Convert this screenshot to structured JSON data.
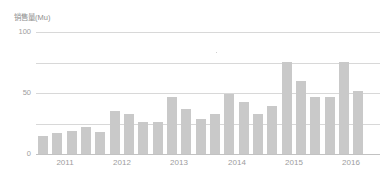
{
  "chart_data": {
    "type": "bar",
    "title": "",
    "subtitle": "",
    "xlabel": "",
    "ylabel": "销售量(Mu)",
    "ylim": [
      0,
      100
    ],
    "yticks": [
      0,
      50,
      100
    ],
    "ytick_labels": [
      "0",
      "50",
      "100"
    ],
    "gridlines": [
      0,
      25,
      50,
      75,
      100
    ],
    "grid": true,
    "legend": false,
    "legend_position": "none",
    "xtick_labels": [
      "2011",
      "2012",
      "2013",
      "2014",
      "2015",
      "2016"
    ],
    "categories": [
      "2011 Q1",
      "2011 Q2",
      "2011 Q3",
      "2011 Q4",
      "2012 Q1",
      "2012 Q2",
      "2012 Q3",
      "2012 Q4",
      "2013 Q1",
      "2013 Q2",
      "2013 Q3",
      "2013 Q4",
      "2014 Q1",
      "2014 Q2",
      "2014 Q3",
      "2014 Q4",
      "2015 Q1",
      "2015 Q2",
      "2015 Q3",
      "2015 Q4",
      "2016 Q1",
      "2016 Q2",
      "2016 Q3",
      "2016 Q4"
    ],
    "values": [
      15,
      17,
      19,
      22,
      18,
      35,
      33,
      26,
      26,
      47,
      37,
      29,
      33,
      49,
      43,
      33,
      39,
      75,
      60,
      47,
      47,
      75,
      52,
      0
    ],
    "bar_color": "#c9c9c9",
    "grid_color": "#d8d8d8",
    "axis_color": "#c2c2c2",
    "text_color": "#9d9d9d",
    "background": "#ffffff"
  }
}
